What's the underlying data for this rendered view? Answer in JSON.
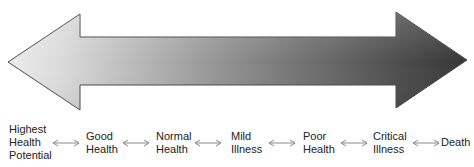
{
  "diagram": {
    "type": "health-illness-continuum",
    "arrow": {
      "direction": "bidirectional",
      "gradient": {
        "start_color": "#e8e8e8",
        "mid_color": "#8c8c8c",
        "end_color": "#383838"
      },
      "outline_color": "#4a4a4a"
    },
    "stages": [
      {
        "id": "highest-health-potential",
        "lines": [
          "Highest",
          "Health",
          "Potential"
        ]
      },
      {
        "id": "good-health",
        "lines": [
          "Good",
          "Health"
        ]
      },
      {
        "id": "normal-health",
        "lines": [
          "Normal",
          "Health"
        ]
      },
      {
        "id": "mild-illness",
        "lines": [
          "Mild",
          "Illness"
        ]
      },
      {
        "id": "poor-health",
        "lines": [
          "Poor",
          "Health"
        ]
      },
      {
        "id": "critical-illness",
        "lines": [
          "Critical",
          "Illness"
        ]
      },
      {
        "id": "death",
        "lines": [
          "Death"
        ]
      }
    ],
    "connector_icon": "double-headed-arrow",
    "connector_color": "#8a8a8a"
  }
}
